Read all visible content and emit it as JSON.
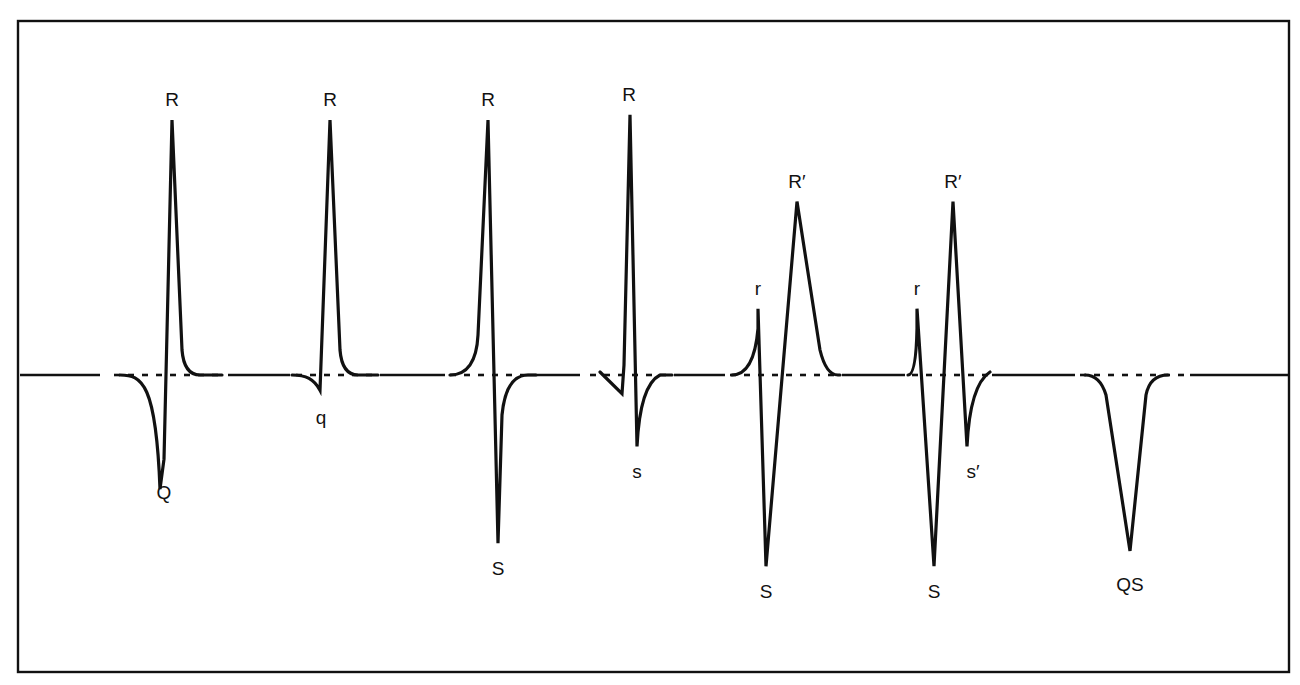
{
  "figure": {
    "baseline_style": "dashed isoelectric line"
  },
  "complexes": [
    {
      "id": "qR-large-Q",
      "waves": [
        {
          "type": "Q",
          "label": "Q",
          "amplitude": -0.33
        },
        {
          "type": "R",
          "label": "R",
          "amplitude": 1.0
        }
      ]
    },
    {
      "id": "qR",
      "waves": [
        {
          "type": "q",
          "label": "q",
          "amplitude": -0.06
        },
        {
          "type": "R",
          "label": "R",
          "amplitude": 1.0
        }
      ]
    },
    {
      "id": "RS",
      "waves": [
        {
          "type": "R",
          "label": "R",
          "amplitude": 1.0
        },
        {
          "type": "S",
          "label": "S",
          "amplitude": -0.66
        }
      ]
    },
    {
      "id": "qRs",
      "waves": [
        {
          "type": "q",
          "label": "",
          "amplitude": -0.05
        },
        {
          "type": "R",
          "label": "R",
          "amplitude": 1.02
        },
        {
          "type": "s",
          "label": "s",
          "amplitude": -0.28
        }
      ]
    },
    {
      "id": "rSR-prime",
      "waves": [
        {
          "type": "r",
          "label": "r",
          "amplitude": 0.26
        },
        {
          "type": "S",
          "label": "S",
          "amplitude": -0.75
        },
        {
          "type": "R'",
          "label": "R′",
          "amplitude": 0.68
        }
      ]
    },
    {
      "id": "rSR-prime-s-prime",
      "waves": [
        {
          "type": "r",
          "label": "r",
          "amplitude": 0.26
        },
        {
          "type": "S",
          "label": "S",
          "amplitude": -0.75
        },
        {
          "type": "R'",
          "label": "R′",
          "amplitude": 0.68
        },
        {
          "type": "s'",
          "label": "s′",
          "amplitude": -0.28
        }
      ]
    },
    {
      "id": "QS",
      "waves": [
        {
          "type": "QS",
          "label": "QS",
          "amplitude": -0.69
        }
      ]
    }
  ]
}
